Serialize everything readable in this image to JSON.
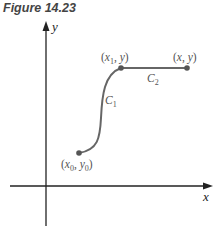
{
  "figure": {
    "caption": "Figure 14.23"
  },
  "axes": {
    "x_label": "x",
    "y_label": "y"
  },
  "points": {
    "start": "(x0, y0)",
    "mid": "(x1, y)",
    "end": "(x, y)"
  },
  "curves": {
    "c1": "C1",
    "c2": "C2"
  },
  "colors": {
    "curve": "#666666",
    "axis": "#222222",
    "text": "#555555"
  }
}
